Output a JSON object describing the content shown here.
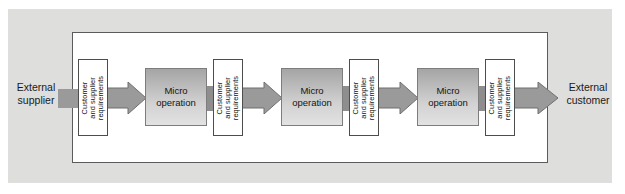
{
  "figure": {
    "name": "internal-customer-supplier-chain",
    "endpoints": {
      "supplier": "External\nsupplier",
      "customer": "External\ncustomer"
    },
    "requirements_label": "Customer\nand supplier\nrequirements",
    "operation_label": "Micro\noperation",
    "nodes": [
      {
        "kind": "requirements",
        "label": "Customer\nand supplier\nrequirements",
        "x": 78
      },
      {
        "kind": "operation",
        "label": "Micro\noperation",
        "x": 145
      },
      {
        "kind": "requirements",
        "label": "Customer\nand supplier\nrequirements",
        "x": 213
      },
      {
        "kind": "operation",
        "label": "Micro\noperation",
        "x": 281
      },
      {
        "kind": "requirements",
        "label": "Customer\nand supplier\nrequirements",
        "x": 349
      },
      {
        "kind": "operation",
        "label": "Micro\noperation",
        "x": 417
      },
      {
        "kind": "requirements",
        "label": "Customer\nand supplier\nrequirements",
        "x": 485
      }
    ],
    "colors": {
      "plate_background": "#dededd",
      "frame_border": "#5b5b5b",
      "frame_fill": "#ffffff",
      "arrow_fill": "#9a9a9a",
      "arrow_stroke": "#6f6f6f",
      "stub_fill": "#8e8e8e",
      "operation_top": "#a5a5a5",
      "operation_bottom": "#e2e2e2",
      "text": "#111111"
    }
  }
}
